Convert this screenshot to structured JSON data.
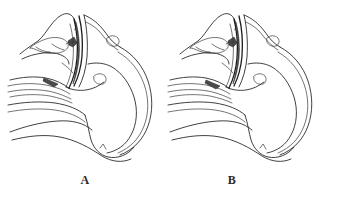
{
  "figure": {
    "background_color": "#ffffff",
    "line_color": "#2b2b2b",
    "label_color": "#2a2a2a",
    "type": "anatomical-line-drawing",
    "panel_count": 2
  },
  "panels": [
    {
      "id": "A",
      "label": "A",
      "subject": "sagittal-section-head-neck-pharynx-larynx"
    },
    {
      "id": "B",
      "label": "B",
      "subject": "sagittal-section-head-neck-pharynx-larynx"
    }
  ]
}
